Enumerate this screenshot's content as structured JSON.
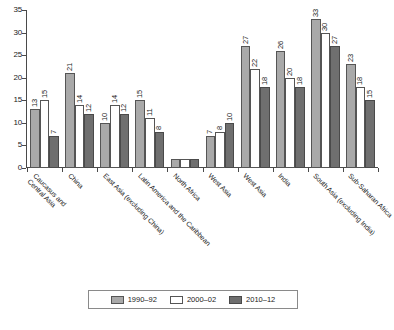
{
  "chart_data": {
    "type": "bar",
    "title": "",
    "subtitle": "",
    "xlabel": "",
    "ylabel": "",
    "ylim": [
      0,
      35
    ],
    "yticks": [
      0,
      5,
      10,
      15,
      20,
      25,
      30,
      35
    ],
    "grid": false,
    "legend_position": "bottom",
    "categories": [
      "Caucasus and\nCentral Asia",
      "China",
      "East Asia (excluding China)",
      "Latin America and the Caribbean",
      "North Africa",
      "West Asia",
      "West Asia",
      "India",
      "South Asia (excluding India)",
      "Sub-Saharan Africa"
    ],
    "series": [
      {
        "name": "1990–92",
        "color": "#a9a9a9",
        "values": [
          13,
          21,
          10,
          15,
          2,
          7,
          27,
          26,
          33,
          23
        ],
        "labels": [
          "13",
          "21",
          "10",
          "15",
          "",
          "7",
          "27",
          "26",
          "33",
          "23"
        ]
      },
      {
        "name": "2000–02",
        "color": "#ffffff",
        "values": [
          15,
          14,
          14,
          11,
          2,
          8,
          22,
          20,
          30,
          18
        ],
        "labels": [
          "15",
          "14",
          "14",
          "11",
          "",
          "8",
          "22",
          "20",
          "30",
          "18"
        ]
      },
      {
        "name": "2010–12",
        "color": "#6f6f6f",
        "values": [
          7,
          12,
          12,
          8,
          2,
          10,
          18,
          18,
          27,
          15
        ],
        "labels": [
          "7",
          "12",
          "12",
          "8",
          "",
          "10",
          "18",
          "18",
          "27",
          "15"
        ]
      }
    ]
  },
  "legend": {
    "items": [
      {
        "label": "1990–92",
        "swatch": "s0"
      },
      {
        "label": "2000–02",
        "swatch": "s1"
      },
      {
        "label": "2010–12",
        "swatch": "s2"
      }
    ]
  }
}
